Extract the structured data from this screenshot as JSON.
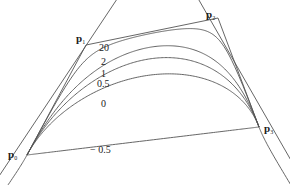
{
  "diagram": {
    "control_points": [
      {
        "name": "p",
        "sub": "0",
        "x": 27,
        "y": 155
      },
      {
        "name": "p",
        "sub": "1",
        "x": 86,
        "y": 45
      },
      {
        "name": "p",
        "sub": "2",
        "x": 218,
        "y": 18
      },
      {
        "name": "p",
        "sub": "3",
        "x": 259,
        "y": 127
      }
    ],
    "curve_weights": [
      "20",
      "2",
      "1",
      "0.5",
      "0",
      "− 0.5"
    ],
    "labels": [
      {
        "text": "20",
        "x": 99,
        "y": 51
      },
      {
        "text": "2",
        "x": 101,
        "y": 65
      },
      {
        "text": "1",
        "x": 101,
        "y": 77
      },
      {
        "text": "0.5",
        "x": 97,
        "y": 86
      },
      {
        "text": "0",
        "x": 102,
        "y": 107
      },
      {
        "text": "− 0.5",
        "x": 90,
        "y": 154
      }
    ],
    "colors": {
      "line": "#555555",
      "text": "#222222",
      "background": "#ffffff"
    }
  }
}
